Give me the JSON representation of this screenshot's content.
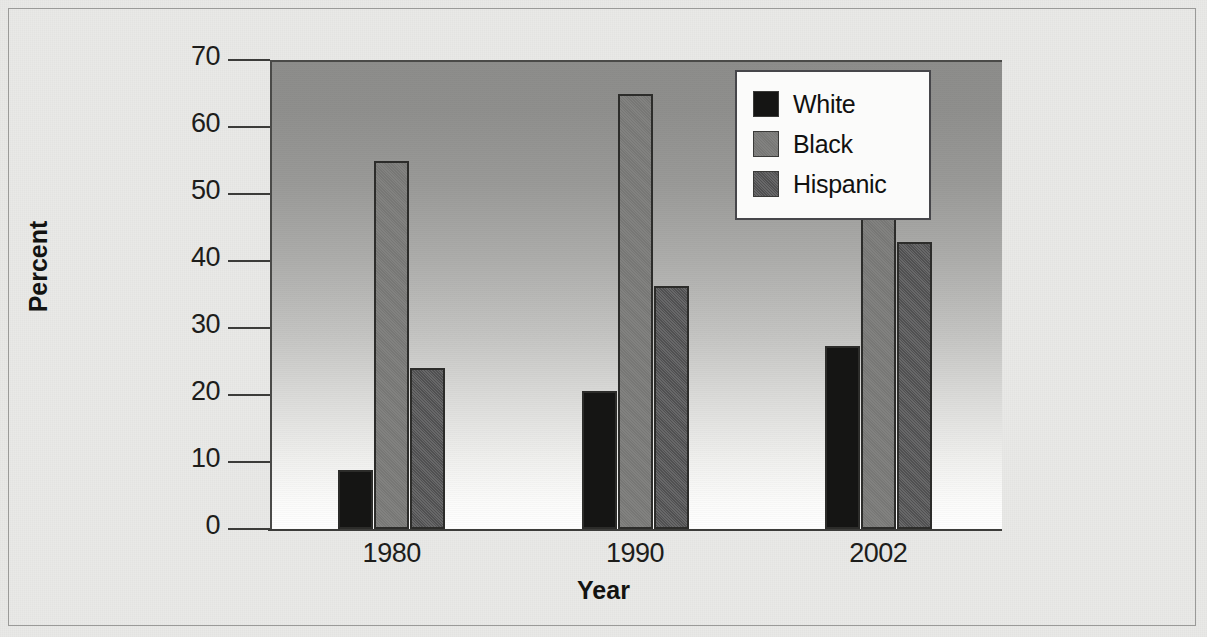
{
  "chart_data": {
    "type": "bar",
    "title": "",
    "subtitle": "",
    "xlabel": "Year",
    "ylabel": "Percent",
    "categories": [
      "1980",
      "1990",
      "2002"
    ],
    "series": [
      {
        "name": "White",
        "values": [
          8.8,
          20.6,
          27.3
        ]
      },
      {
        "name": "Black",
        "values": [
          55.0,
          65.0,
          68.0
        ]
      },
      {
        "name": "Hispanic",
        "values": [
          24.0,
          36.3,
          42.8
        ]
      }
    ],
    "ylim": [
      0,
      70
    ],
    "ytick_values": [
      0,
      10,
      20,
      30,
      40,
      50,
      60,
      70
    ],
    "ytick_labels": [
      "0",
      "10",
      "20",
      "30",
      "40",
      "50",
      "60",
      "70"
    ],
    "grid": false,
    "legend_position": "top-right",
    "legend_entries": [
      "White",
      "Black",
      "Hispanic"
    ],
    "annotations": [],
    "colors": {
      "White": "#151514",
      "Black": "#7b7b79",
      "Hispanic": "#59595a",
      "axis": "#3c3c3a",
      "plot_background_top": "#8d8d8b",
      "plot_background_bottom": "#ffffff",
      "figure_background": "#e9e9e7"
    }
  },
  "axes": {
    "y_title": "Percent",
    "x_title": "Year"
  },
  "legend": {
    "items": [
      {
        "label": "White",
        "swatch": "legend-swatch-white"
      },
      {
        "label": "Black",
        "swatch": "legend-swatch-black"
      },
      {
        "label": "Hispanic",
        "swatch": "legend-swatch-hispanic"
      }
    ]
  }
}
